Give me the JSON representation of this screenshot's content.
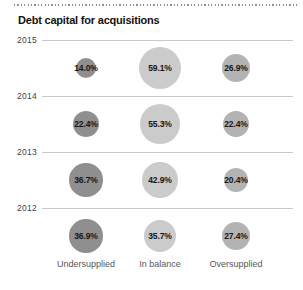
{
  "title": "Debt capital for acquisitions",
  "chart_data": {
    "type": "bubble",
    "title": "Debt capital for acquisitions",
    "rows": [
      "2015",
      "2014",
      "2013",
      "2012"
    ],
    "columns": [
      "Undersupplied",
      "In balance",
      "Oversupplied"
    ],
    "values": [
      [
        14.0,
        59.1,
        26.9
      ],
      [
        22.4,
        55.3,
        22.4
      ],
      [
        36.7,
        42.9,
        20.4
      ],
      [
        36.9,
        35.7,
        27.4
      ]
    ],
    "value_suffix": "%",
    "value_decimals": 1,
    "column_colors": [
      "#8f8f8f",
      "#cbcbcb",
      "#b3b3b3"
    ],
    "size_encoding": "area-proportional",
    "gridline_color": "#c9c9c9",
    "layout_hints": {
      "row_gridline_ys": [
        40,
        96,
        152,
        208
      ],
      "column_center_xs": [
        86,
        160,
        236
      ],
      "bubble_center_offset_below_line": 28,
      "radius_scale_factor": 2.75
    }
  }
}
